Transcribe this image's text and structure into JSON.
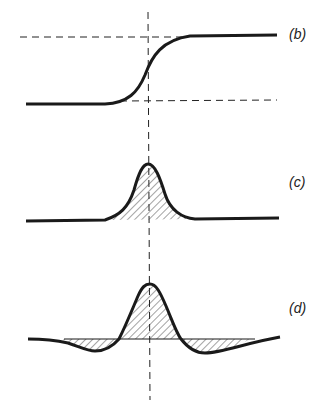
{
  "figure": {
    "panels": [
      {
        "id": "b",
        "label": "(b)",
        "description": "step (sigmoid) curve with dashed upper and lower level lines"
      },
      {
        "id": "c",
        "label": "(c)",
        "description": "single hatched peak (first derivative)"
      },
      {
        "id": "d",
        "label": "(d)",
        "description": "hatched peak with negative side lobes (second derivative-like)"
      }
    ],
    "center_line": "vertical dashed line through peak/inflection point",
    "colors": {
      "stroke": "#1a1a1a",
      "hatch": "#333333",
      "background": "#ffffff"
    }
  }
}
